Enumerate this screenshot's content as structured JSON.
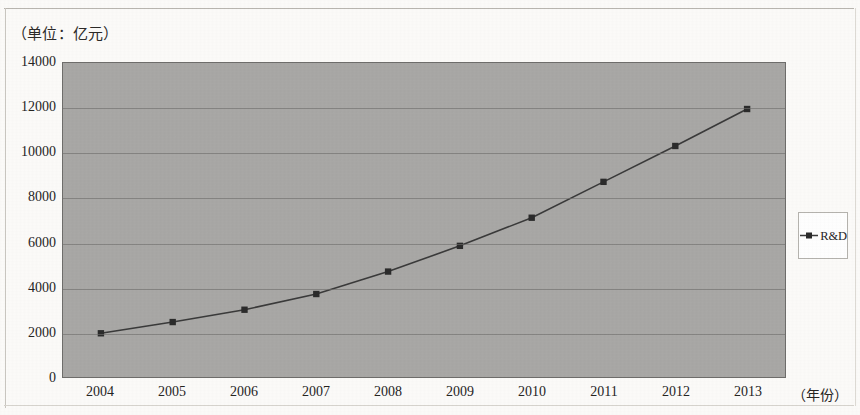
{
  "unit_label": "（单位：亿元）",
  "x_axis_title": "（年份）",
  "legend": {
    "series_label": "R&D",
    "marker": "square-line-marker"
  },
  "axes": {
    "y_ticks": [
      "0",
      "2000",
      "4000",
      "6000",
      "8000",
      "10000",
      "12000",
      "14000"
    ],
    "x_ticks": [
      "2004",
      "2005",
      "2006",
      "2007",
      "2008",
      "2009",
      "2010",
      "2011",
      "2012",
      "2013"
    ]
  },
  "colors": {
    "plot_background": "#a9a8a6",
    "plot_border": "#6e6d6b",
    "gridline": "#6f6e6c",
    "series_line": "#3a3a3a",
    "series_marker": "#2b2b2b",
    "text": "#26241f",
    "page_background": "#fcfbf9",
    "legend_background": "#ffffff",
    "legend_border": "#b5b3ae"
  },
  "chart_data": {
    "type": "line",
    "title": "（单位：亿元）",
    "xlabel": "（年份）",
    "ylabel": "亿元",
    "categories": [
      "2004",
      "2005",
      "2006",
      "2007",
      "2008",
      "2009",
      "2010",
      "2011",
      "2012",
      "2013"
    ],
    "series": [
      {
        "name": "R&D",
        "values": [
          1950,
          2450,
          3000,
          3700,
          4700,
          5850,
          7100,
          8700,
          10300,
          11950
        ]
      }
    ],
    "ylim": [
      0,
      14000
    ],
    "ytick_interval": 2000,
    "grid": true,
    "legend_position": "right"
  }
}
